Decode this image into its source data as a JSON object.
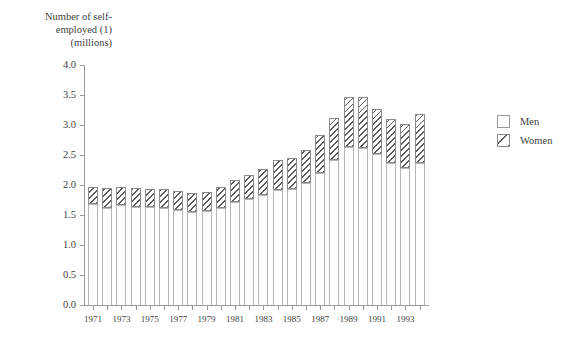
{
  "chart_data": {
    "type": "bar",
    "title": "Number of self-\nemployed (1)\n(millions)",
    "xlabel": "",
    "ylabel": "Number of self-employed (1) (millions)",
    "stacked": true,
    "grid": false,
    "legend_position": "right",
    "ylim": [
      0.0,
      4.0
    ],
    "ytick_labels": [
      "4.0",
      "3.5",
      "3.0",
      "2.5",
      "2.0",
      "1.5",
      "1.0",
      "0.5",
      "0.0"
    ],
    "ytick_values": [
      4.0,
      3.5,
      3.0,
      2.5,
      2.0,
      1.5,
      1.0,
      0.5,
      0.0
    ],
    "categories": [
      "1971",
      "1972",
      "1973",
      "1974",
      "1975",
      "1976",
      "1977",
      "1978",
      "1979",
      "1980",
      "1981",
      "1982",
      "1983",
      "1984",
      "1985",
      "1986",
      "1987",
      "1988",
      "1989",
      "1990",
      "1991",
      "1992",
      "1993",
      "1994"
    ],
    "xtick_labels": [
      "1971",
      "1973",
      "1975",
      "1977",
      "1979",
      "1981",
      "1983",
      "1985",
      "1987",
      "1989",
      "1991",
      "1993"
    ],
    "series": [
      {
        "name": "Men",
        "values": [
          1.68,
          1.61,
          1.66,
          1.64,
          1.63,
          1.62,
          1.58,
          1.55,
          1.56,
          1.62,
          1.72,
          1.76,
          1.83,
          1.92,
          1.93,
          2.04,
          2.2,
          2.42,
          2.63,
          2.61,
          2.51,
          2.37,
          2.29,
          2.36
        ],
        "hatch": "none",
        "color": "#ffffff"
      },
      {
        "name": "Women",
        "values": [
          0.28,
          0.34,
          0.3,
          0.31,
          0.31,
          0.31,
          0.32,
          0.32,
          0.32,
          0.34,
          0.37,
          0.4,
          0.44,
          0.49,
          0.52,
          0.55,
          0.63,
          0.7,
          0.84,
          0.86,
          0.76,
          0.73,
          0.72,
          0.82
        ]
      }
    ],
    "totals": [
      1.96,
      1.95,
      1.96,
      1.95,
      1.94,
      1.93,
      1.9,
      1.87,
      1.88,
      1.96,
      2.09,
      2.16,
      2.27,
      2.41,
      2.45,
      2.59,
      2.83,
      3.12,
      3.47,
      3.47,
      3.27,
      3.1,
      3.01,
      3.18
    ]
  },
  "legend": {
    "items": [
      {
        "label": "Men"
      },
      {
        "label": "Women"
      }
    ]
  }
}
